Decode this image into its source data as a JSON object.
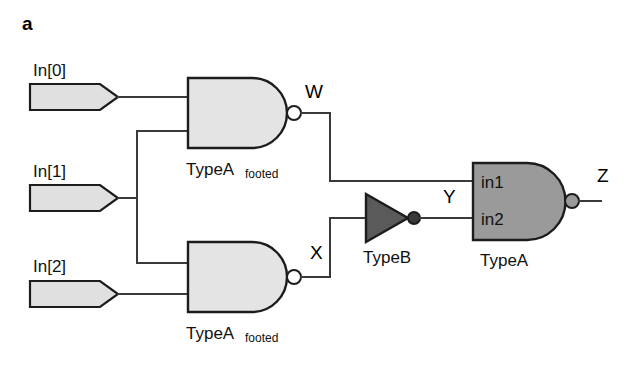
{
  "figure": {
    "panel_label": "a",
    "background_color": "#ffffff",
    "wire_color": "#3a3a3a",
    "outline_color": "#1c1c1c",
    "light_gate_fill": "#e4e4e4",
    "dark_gate_fill": "#9a9a9a",
    "input_pin_fill": "#e0e0e0"
  },
  "inputs": [
    {
      "label": "In[0]",
      "name": "input-pin-in0"
    },
    {
      "label": "In[1]",
      "name": "input-pin-in1"
    },
    {
      "label": "In[2]",
      "name": "input-pin-in2"
    }
  ],
  "gates": [
    {
      "id": "nand-top",
      "type": "NAND",
      "label_main": "TypeA",
      "label_sub": "footed",
      "fill": "#e4e4e4",
      "output_net": "W"
    },
    {
      "id": "nand-bottom",
      "type": "NAND",
      "label_main": "TypeA",
      "label_sub": "footed",
      "fill": "#e4e4e4",
      "output_net": "X"
    },
    {
      "id": "inverter",
      "type": "INV",
      "label_main": "TypeB",
      "label_sub": "",
      "fill": "#5a5a5a",
      "output_net": "Y"
    },
    {
      "id": "nand-output",
      "type": "NAND",
      "label_main": "TypeA",
      "label_sub": "",
      "fill": "#9a9a9a",
      "output_net": "Z",
      "input_pin_labels": [
        "in1",
        "in2"
      ]
    }
  ],
  "nets": [
    {
      "label": "W"
    },
    {
      "label": "X"
    },
    {
      "label": "Y"
    },
    {
      "label": "Z"
    }
  ],
  "output_pin_labels": {
    "in1": "in1",
    "in2": "in2"
  }
}
